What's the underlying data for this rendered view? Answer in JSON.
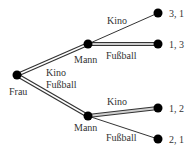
{
  "diagram": {
    "type": "game-tree",
    "root": {
      "label": "Frau"
    },
    "root_edge_labels": [
      "Kino",
      "Fußball"
    ],
    "nodes": [
      {
        "label": "Mann",
        "branch": "Kino",
        "edges": [
          {
            "label": "Kino",
            "payoff": "3, 1",
            "highlighted": false
          },
          {
            "label": "Fußball",
            "payoff": "1, 3",
            "highlighted": true
          }
        ]
      },
      {
        "label": "Mann",
        "branch": "Fußball",
        "edges": [
          {
            "label": "Kino",
            "payoff": "1, 2",
            "highlighted": true
          },
          {
            "label": "Fußball",
            "payoff": "2, 1",
            "highlighted": false
          }
        ]
      }
    ],
    "colors": {
      "node": "#000000",
      "edge": "#333333",
      "highlight": "#cfcfcf"
    }
  }
}
